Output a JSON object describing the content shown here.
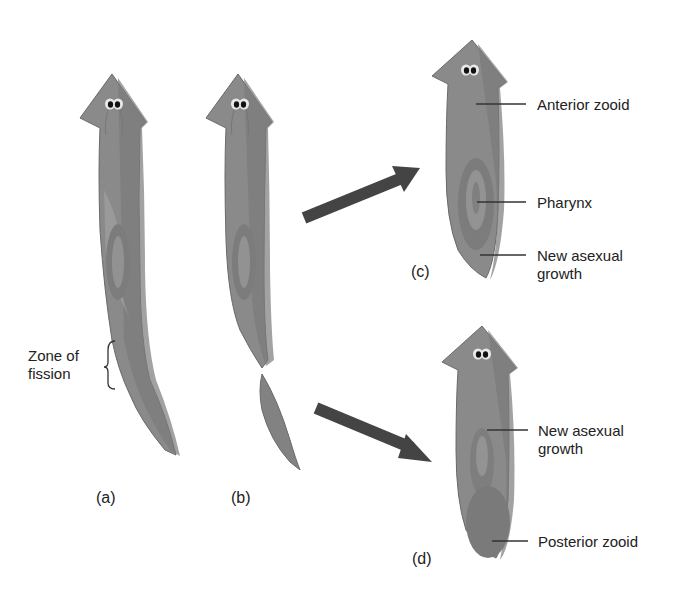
{
  "figure": {
    "panels": [
      {
        "id": "a",
        "label": "(a)"
      },
      {
        "id": "b",
        "label": "(b)"
      },
      {
        "id": "c",
        "label": "(c)"
      },
      {
        "id": "d",
        "label": "(d)"
      }
    ],
    "annotations": {
      "zone_of_fission": {
        "line1": "Zone of",
        "line2": "fission"
      },
      "anterior_zooid": "Anterior zooid",
      "pharynx": "Pharynx",
      "new_growth_c": {
        "line1": "New asexual",
        "line2": "growth"
      },
      "new_growth_d": {
        "line1": "New asexual",
        "line2": "growth"
      },
      "posterior_zooid": "Posterior zooid"
    },
    "colors": {
      "body": "#8e8e8e",
      "body_dark": "#6f6f6f",
      "body_light": "#a6a6a6",
      "arrow": "#444444",
      "leader": "#333333"
    }
  }
}
